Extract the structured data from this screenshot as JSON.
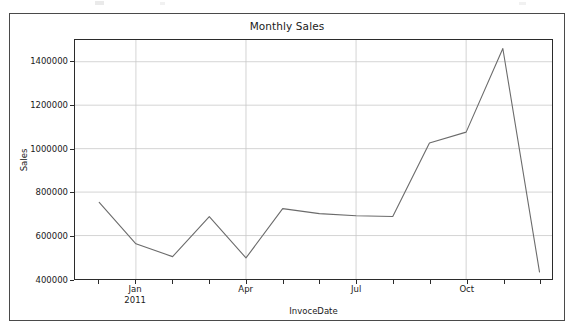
{
  "figure": {
    "title": "Monthly Sales",
    "xlabel": "InvoceDate",
    "ylabel": "Sales",
    "line_color": "#6b6b6b",
    "grid_color": "#c9c9c9",
    "axes_color": "#2b2b2b",
    "background": "#ffffff"
  },
  "chart_data": {
    "type": "line",
    "title": "Monthly Sales",
    "xlabel": "InvoceDate",
    "ylabel": "Sales",
    "x": [
      "2010-12",
      "2011-01",
      "2011-02",
      "2011-03",
      "2011-04",
      "2011-05",
      "2011-06",
      "2011-07",
      "2011-08",
      "2011-09",
      "2011-10",
      "2011-11",
      "2011-12"
    ],
    "values": [
      753000,
      562000,
      503000,
      687000,
      497000,
      724000,
      701000,
      691000,
      688000,
      1026000,
      1076000,
      1461000,
      432000
    ],
    "series": [
      {
        "name": "Sales",
        "values": [
          753000,
          562000,
          503000,
          687000,
          497000,
          724000,
          701000,
          691000,
          688000,
          1026000,
          1076000,
          1461000,
          432000
        ]
      }
    ],
    "ylim": [
      400000,
      1500000
    ],
    "yticks": [
      400000,
      600000,
      800000,
      1000000,
      1200000,
      1400000
    ],
    "ytick_labels": [
      "400000",
      "600000",
      "800000",
      "1000000",
      "1200000",
      "1400000"
    ],
    "xticks": [
      "Jan\n2011",
      "Apr",
      "Jul",
      "Oct"
    ],
    "xtick_positions": [
      1,
      4,
      7,
      10
    ],
    "xtick_minor_count": 13,
    "grid": true,
    "legend": null,
    "marker": "none",
    "linewidth": 1
  }
}
